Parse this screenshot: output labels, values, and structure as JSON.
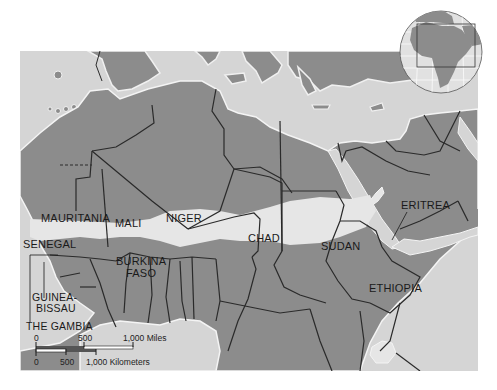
{
  "map": {
    "title": "Sahel region of Africa",
    "colors": {
      "sea": "#d5d5d5",
      "land": "#8c8c8c",
      "sahel_band": "#e6e6e6",
      "border": "#2a2a2a",
      "coast_highlight": "#f4f4f4"
    },
    "country_labels": [
      {
        "id": "mauritania",
        "label": "MAURITANIA"
      },
      {
        "id": "mali",
        "label": "MALI"
      },
      {
        "id": "niger",
        "label": "NIGER"
      },
      {
        "id": "chad",
        "label": "CHAD"
      },
      {
        "id": "sudan",
        "label": "SUDAN"
      },
      {
        "id": "eritrea",
        "label": "ERITREA"
      },
      {
        "id": "senegal",
        "label": "SENEGAL"
      },
      {
        "id": "burkina_faso_1",
        "label": "BURKINA"
      },
      {
        "id": "burkina_faso_2",
        "label": "FASO"
      },
      {
        "id": "ethiopia",
        "label": "ETHIOPIA"
      },
      {
        "id": "guinea_bissau_1",
        "label": "GUINEA-"
      },
      {
        "id": "guinea_bissau_2",
        "label": "BISSAU"
      },
      {
        "id": "the_gambia",
        "label": "THE GAMBIA"
      }
    ],
    "scale_bar": {
      "miles_ticks": [
        "0",
        "500",
        "1,000 Miles"
      ],
      "km_ticks": [
        "0",
        "500",
        "1,000 Kilometers"
      ]
    },
    "locator_globe": {
      "region_highlighted": "North Africa / Sahel"
    }
  }
}
